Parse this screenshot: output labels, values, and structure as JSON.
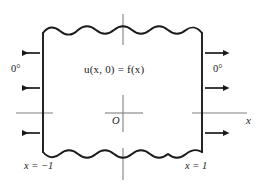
{
  "figure": {
    "type": "diagram",
    "colors": {
      "stroke": "#1a1a1a",
      "axis": "#808080",
      "background": "#ffffff",
      "text": "#1a1a1a"
    },
    "labels": {
      "initial_condition": "u(x, 0) = f(x)",
      "left_boundary_temp": "0°",
      "right_boundary_temp": "0°",
      "left_edge": "x = −1",
      "right_edge": "x = 1",
      "origin": "O",
      "x_axis": "x"
    },
    "arrows": {
      "left_count": 3,
      "right_count": 3,
      "left_direction": "left",
      "right_direction": "right"
    },
    "axes": {
      "x_axis_label": "x",
      "y_axis_label": "",
      "origin_label": "O",
      "grid": false
    }
  }
}
